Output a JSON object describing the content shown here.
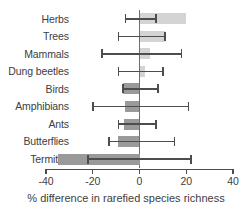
{
  "chart_data": {
    "type": "bar",
    "orientation": "horizontal",
    "title": "",
    "xlabel": "% difference in rarefied species richness",
    "ylabel": "",
    "xlim": [
      -40,
      40
    ],
    "xticks": [
      -40,
      -20,
      0,
      20,
      40
    ],
    "xticklabels": [
      "-40",
      "-20",
      "0",
      "20",
      "40"
    ],
    "grid": false,
    "legend": null,
    "zero_reference_line": 0,
    "colors": {
      "positive_bar": "#d4d4d4",
      "negative_bar": "#9a9a9a",
      "error_bar": "#4d4d4d",
      "axis": "#4d4d4d",
      "zero_line": "#6e6e6e",
      "text": "#404040"
    },
    "categories": [
      "Herbs",
      "Trees",
      "Mammals",
      "Dung beetles",
      "Birds",
      "Amphibians",
      "Ants",
      "Butterflies",
      "Termites"
    ],
    "values": [
      20,
      11,
      4.5,
      2.5,
      -7,
      -6,
      -6.5,
      -9,
      -35
    ],
    "error_low": [
      -6,
      -9,
      -16,
      -9,
      -7,
      -20,
      -9,
      -13,
      -22
    ],
    "error_high": [
      7,
      11,
      18,
      10,
      8,
      21,
      7,
      15,
      22
    ],
    "points": [
      {
        "category": "Herbs",
        "value": 20,
        "error_low": -6,
        "error_high": 7
      },
      {
        "category": "Trees",
        "value": 11,
        "error_low": -9,
        "error_high": 11
      },
      {
        "category": "Mammals",
        "value": 4.5,
        "error_low": -16,
        "error_high": 18
      },
      {
        "category": "Dung beetles",
        "value": 2.5,
        "error_low": -9,
        "error_high": 10
      },
      {
        "category": "Birds",
        "value": -7,
        "error_low": -7,
        "error_high": 8
      },
      {
        "category": "Amphibians",
        "value": -6,
        "error_low": -20,
        "error_high": 21
      },
      {
        "category": "Ants",
        "value": -6.5,
        "error_low": -9,
        "error_high": 7
      },
      {
        "category": "Butterflies",
        "value": -9,
        "error_low": -13,
        "error_high": 15
      },
      {
        "category": "Termites",
        "value": -35,
        "error_low": -22,
        "error_high": 22
      }
    ]
  }
}
